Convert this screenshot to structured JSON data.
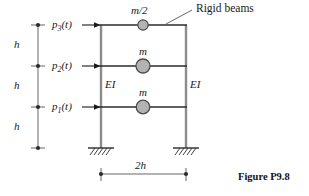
{
  "figure": {
    "caption": "Figure P9.8",
    "annotation_rigid_beams": "Rigid beams",
    "colors": {
      "beam_line": "#2b2b2b",
      "column_line": "#8c8c8c",
      "mass_fill": "#b3b3b3",
      "mass_stroke": "#4d4d4d",
      "dimension_line": "#555555",
      "text": "#1a1a1a",
      "background": "#ffffff"
    },
    "forces": [
      {
        "id": "p3",
        "base": "p",
        "sub": "3",
        "suffix": "(t)",
        "text": "p3(t)",
        "level": "top"
      },
      {
        "id": "p2",
        "base": "p",
        "sub": "2",
        "suffix": "(t)",
        "text": "p2(t)",
        "level": "middle"
      },
      {
        "id": "p1",
        "base": "p",
        "sub": "1",
        "suffix": "(t)",
        "text": "p1(t)",
        "level": "bottom"
      }
    ],
    "masses": [
      {
        "id": "mass-top",
        "label": "m/2",
        "level": "top"
      },
      {
        "id": "mass-middle",
        "label": "m",
        "level": "middle"
      },
      {
        "id": "mass-bottom",
        "label": "m",
        "level": "bottom"
      }
    ],
    "stiffness": [
      {
        "id": "ei-left",
        "label": "EI",
        "side": "left"
      },
      {
        "id": "ei-right",
        "label": "EI",
        "side": "right"
      }
    ],
    "height_dimensions": [
      {
        "id": "h-top",
        "label": "h"
      },
      {
        "id": "h-middle",
        "label": "h"
      },
      {
        "id": "h-bottom",
        "label": "h"
      }
    ],
    "span_dimension": {
      "id": "span-2h",
      "label": "2h"
    },
    "supports": [
      {
        "id": "support-left",
        "type": "fixed"
      },
      {
        "id": "support-right",
        "type": "fixed"
      }
    ]
  }
}
